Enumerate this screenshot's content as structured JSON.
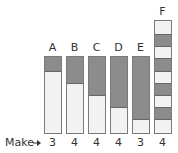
{
  "row_label": "Make",
  "colors": {
    "dark": "#8c8c8c",
    "light": "#f2f2f2",
    "border": "#7a7a7a"
  },
  "bars": [
    {
      "label": "A",
      "make": "3",
      "left": 44,
      "top": 56,
      "height": 78,
      "dark": [
        [
          0,
          15
        ]
      ]
    },
    {
      "label": "B",
      "make": "4",
      "left": 66,
      "top": 56,
      "height": 78,
      "dark": [
        [
          0,
          27
        ]
      ]
    },
    {
      "label": "C",
      "make": "4",
      "left": 88,
      "top": 56,
      "height": 78,
      "dark": [
        [
          0,
          39
        ]
      ]
    },
    {
      "label": "D",
      "make": "4",
      "left": 110,
      "top": 56,
      "height": 78,
      "dark": [
        [
          0,
          51
        ]
      ]
    },
    {
      "label": "E",
      "make": "3",
      "left": 132,
      "top": 56,
      "height": 78,
      "dark": [
        [
          0,
          63
        ]
      ]
    },
    {
      "label": "F",
      "make": "4",
      "left": 154,
      "top": 20,
      "height": 114,
      "dark": [
        [
          14,
          12
        ],
        [
          38,
          13
        ],
        [
          63,
          12
        ],
        [
          87,
          12
        ]
      ]
    }
  ]
}
